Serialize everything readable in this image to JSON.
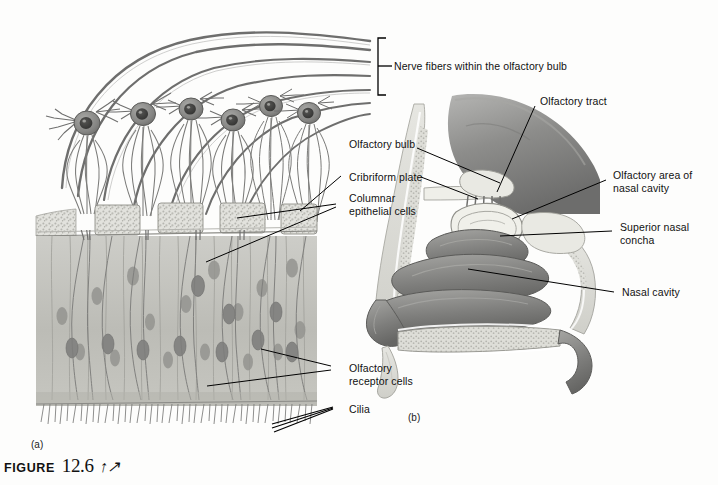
{
  "figure": {
    "word": "Figure",
    "number": "12.6",
    "glyph_icon": "anatomy-person-glyph"
  },
  "panels": [
    {
      "id": "a",
      "tag": "(a)",
      "description": "Olfactory receptor cells and olfactory epithelium, microscopic view"
    },
    {
      "id": "b",
      "tag": "(b)",
      "description": "Sagittal section of nasal cavity showing olfactory bulb and tract"
    }
  ],
  "labels_left": [
    {
      "name": "nerve-fibers",
      "text": "Nerve fibers within the olfactory bulb"
    },
    {
      "name": "olfactory-bulb",
      "text": "Olfactory bulb"
    },
    {
      "name": "cribriform-plate",
      "text": "Cribriform plate"
    },
    {
      "name": "columnar-epithelial-cells",
      "text": "Columnar\nepithelial cells"
    },
    {
      "name": "olfactory-receptor-cells",
      "text": "Olfactory\nreceptor cells"
    },
    {
      "name": "cilia",
      "text": "Cilia"
    }
  ],
  "labels_right": [
    {
      "name": "olfactory-tract",
      "text": "Olfactory tract"
    },
    {
      "name": "olfactory-area-nasal-cavity",
      "text": "Olfactory area of\nnasal cavity"
    },
    {
      "name": "superior-nasal-concha",
      "text": "Superior nasal\nconcha"
    },
    {
      "name": "nasal-cavity",
      "text": "Nasal cavity"
    }
  ],
  "colors": {
    "ink": "#111111",
    "leader": "#000000",
    "page": "#fdfdfc",
    "tissue_mid": "#9a9a98",
    "tissue_dark": "#6f6f6e",
    "tissue_light": "#c9c9c6",
    "epithelium": "#bdbdb8",
    "bone": "#dcdcd7",
    "brain": "#8e8e8c"
  }
}
